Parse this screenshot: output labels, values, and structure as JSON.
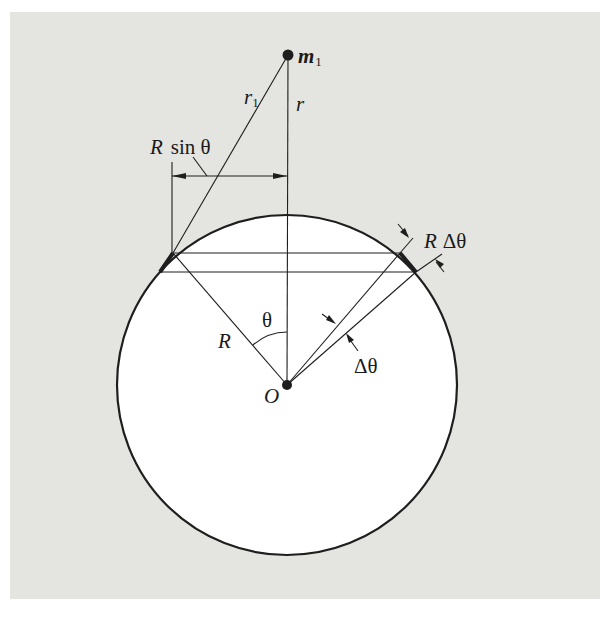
{
  "figure": {
    "colors": {
      "panel": "#e4e4e0",
      "ink": "#1e1e1e",
      "sphere_fill": "#ffffff"
    },
    "labels": {
      "mass": "m",
      "mass_subscript": "1",
      "r1": "r",
      "r1_subscript": "1",
      "r": "r",
      "r_sin_theta_R": "R",
      "r_sin_theta_rest": "sin θ",
      "r_delta_theta_R": "R",
      "r_delta_theta_rest": "Δθ",
      "radius": "R",
      "theta": "θ",
      "delta_theta": "Δθ",
      "origin": "O"
    },
    "geometry": {
      "center": [
        287,
        385
      ],
      "radius": 170,
      "mass_point": [
        288,
        55
      ],
      "upper_chord_y": 253,
      "lower_chord_y": 272
    }
  }
}
